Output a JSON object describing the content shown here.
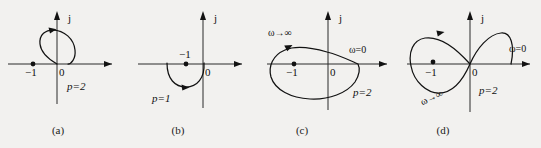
{
  "figure": {
    "background_color": "#f2f1ef",
    "curve_color": "#121212",
    "axis_color": "#2b2b2b",
    "width": 541,
    "height": 148
  },
  "panels": [
    {
      "id": "a",
      "caption": "(a)",
      "axis_labels": {
        "imaginary": "j",
        "origin": "0"
      },
      "critical_point": "−1",
      "annotations": [
        {
          "name": "pole-count",
          "text": "p=2"
        }
      ]
    },
    {
      "id": "b",
      "caption": "(b)",
      "axis_labels": {
        "imaginary": "j",
        "origin": "0"
      },
      "critical_point": "−1",
      "annotations": [
        {
          "name": "pole-count",
          "text": "p=1"
        }
      ]
    },
    {
      "id": "c",
      "caption": "(c)",
      "axis_labels": {
        "imaginary": "j",
        "origin": "0"
      },
      "critical_point": "−1",
      "annotations": [
        {
          "name": "omega-infinity",
          "text": "ω→∞"
        },
        {
          "name": "omega-zero",
          "text": "ω=0"
        },
        {
          "name": "pole-count",
          "text": "p=2"
        }
      ]
    },
    {
      "id": "d",
      "caption": "(d)",
      "axis_labels": {
        "imaginary": "j",
        "origin": "0"
      },
      "critical_point": "−1",
      "annotations": [
        {
          "name": "omega-infinity",
          "text": "ω→∞"
        },
        {
          "name": "omega-zero",
          "text": "ω=0"
        },
        {
          "name": "pole-count",
          "text": "p=2"
        }
      ]
    }
  ]
}
